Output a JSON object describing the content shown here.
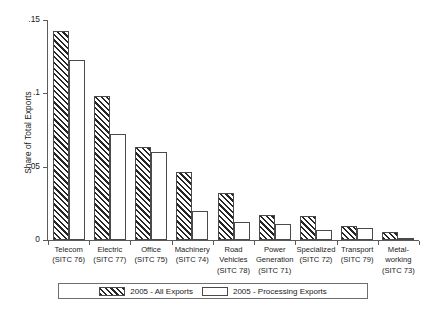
{
  "chart_data": {
    "type": "bar",
    "title": "",
    "subtitle": "",
    "xlabel": "",
    "ylabel": "Share of Total Exports",
    "ylim": [
      0,
      0.15
    ],
    "yticks": [
      0,
      0.05,
      0.1,
      0.15
    ],
    "ytick_labels": [
      "0",
      ".05",
      ".1",
      ".15"
    ],
    "grid": false,
    "legend_position": "bottom",
    "categories": [
      "Telecom (SITC 76)",
      "Electric (SITC 77)",
      "Office (SITC 75)",
      "Machinery (SITC 74)",
      "Road Vehicles (SITC 78)",
      "Power Generation (SITC 71)",
      "Specialized (SITC 72)",
      "Transport (SITC 79)",
      "Metal-working (SITC 73)"
    ],
    "category_lines": [
      [
        "Telecom",
        "(SITC 76)",
        ""
      ],
      [
        "Electric",
        "(SITC 77)",
        ""
      ],
      [
        "Office",
        "(SITC 75)",
        ""
      ],
      [
        "Machinery",
        "(SITC 74)",
        ""
      ],
      [
        "Road",
        "Vehicles",
        "(SITC 78)"
      ],
      [
        "Power",
        "Generation",
        "(SITC 71)"
      ],
      [
        "Specialized",
        "(SITC 72)",
        ""
      ],
      [
        "Transport",
        "(SITC 79)",
        ""
      ],
      [
        "Metal-",
        "working",
        "(SITC 73)"
      ]
    ],
    "series": [
      {
        "name": "2005 - All Exports",
        "style": "hatched",
        "values": [
          0.1425,
          0.098,
          0.0635,
          0.0465,
          0.032,
          0.017,
          0.0165,
          0.0095,
          0.0055
        ]
      },
      {
        "name": "2005 - Processing Exports",
        "style": "outline",
        "values": [
          0.1225,
          0.072,
          0.06,
          0.0195,
          0.012,
          0.011,
          0.007,
          0.008,
          0.0015
        ]
      }
    ]
  },
  "legend": {
    "entries": [
      {
        "label": "2005 - All Exports",
        "style": "hatched"
      },
      {
        "label": "2005 - Processing Exports",
        "style": "outline"
      }
    ]
  },
  "colors": {
    "hatch": "#262626",
    "bar_border": "#4a4a4a",
    "axis": "#5a5a5a",
    "text": "#1a1a1a",
    "background": "#ffffff"
  }
}
